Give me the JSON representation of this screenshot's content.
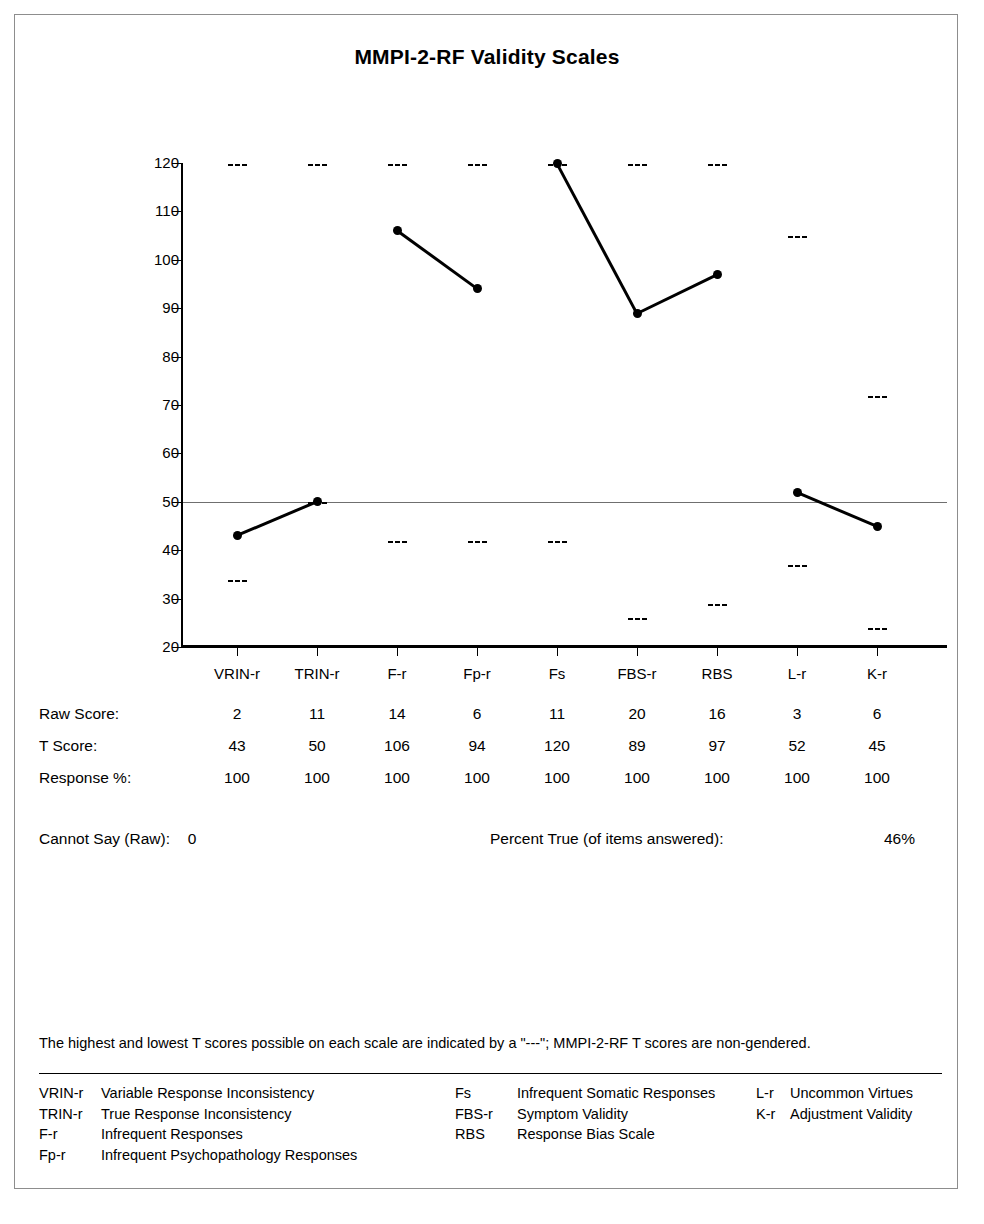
{
  "report": {
    "title": "MMPI-2-RF Validity Scales",
    "footnote": "The highest and lowest T scores possible on each scale are indicated by a \"---\"; MMPI-2-RF T scores are non-gendered.",
    "cannot_say_label": "Cannot Say (Raw):",
    "cannot_say_value": "0",
    "percent_true_label": "Percent True (of items answered):",
    "percent_true_value": "46%"
  },
  "chart_data": {
    "type": "line",
    "title": "MMPI-2-RF Validity Scales",
    "xlabel": "",
    "ylabel": "T Score",
    "ylim": [
      20,
      120
    ],
    "yticks": [
      20,
      30,
      40,
      50,
      60,
      70,
      80,
      90,
      100,
      110,
      120
    ],
    "grid": false,
    "legend": "none",
    "reference_line": 50,
    "categories": [
      "VRIN-r",
      "TRIN-r",
      "F-r",
      "Fp-r",
      "Fs",
      "FBS-r",
      "RBS",
      "L-r",
      "K-r"
    ],
    "series": [
      {
        "name": "T Score",
        "values": [
          43,
          50,
          106,
          94,
          120,
          89,
          97,
          52,
          45
        ]
      }
    ],
    "annotations": {
      "max_possible": [
        120,
        120,
        120,
        120,
        120,
        120,
        120,
        105,
        72
      ],
      "min_possible": [
        34,
        50,
        42,
        42,
        42,
        26,
        29,
        37,
        24
      ]
    },
    "segments": [
      [
        0,
        1
      ],
      [
        2,
        3
      ],
      [
        4,
        5
      ],
      [
        5,
        6
      ],
      [
        7,
        8
      ]
    ]
  },
  "score_table": {
    "rows": [
      {
        "label": "Raw Score:",
        "values": [
          "2",
          "11",
          "14",
          "6",
          "11",
          "20",
          "16",
          "3",
          "6"
        ]
      },
      {
        "label": "T Score:",
        "values": [
          "43",
          "50",
          "106",
          "94",
          "120",
          "89",
          "97",
          "52",
          "45"
        ]
      },
      {
        "label": "Response %:",
        "values": [
          "100",
          "100",
          "100",
          "100",
          "100",
          "100",
          "100",
          "100",
          "100"
        ]
      }
    ]
  },
  "key": {
    "column1": [
      {
        "abbr": "VRIN-r",
        "desc": "Variable Response Inconsistency"
      },
      {
        "abbr": "TRIN-r",
        "desc": "True Response Inconsistency"
      },
      {
        "abbr": "F-r",
        "desc": "Infrequent Responses"
      },
      {
        "abbr": "Fp-r",
        "desc": "Infrequent Psychopathology Responses"
      }
    ],
    "column2": [
      {
        "abbr": "Fs",
        "desc": "Infrequent Somatic Responses"
      },
      {
        "abbr": "FBS-r",
        "desc": "Symptom Validity"
      },
      {
        "abbr": "RBS",
        "desc": "Response Bias Scale"
      }
    ],
    "column3": [
      {
        "abbr": "L-r",
        "desc": "Uncommon Virtues"
      },
      {
        "abbr": "K-r",
        "desc": "Adjustment Validity"
      }
    ]
  }
}
